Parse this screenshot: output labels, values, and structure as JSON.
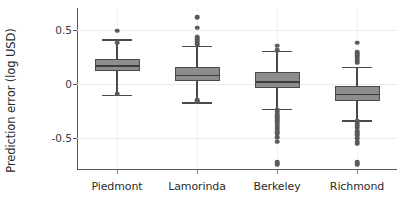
{
  "chart_data": {
    "type": "box",
    "title": "",
    "xlabel": "",
    "ylabel": "Prediction error (log USD)",
    "categories": [
      "Piedmont",
      "Lamorinda",
      "Berkeley",
      "Richmond"
    ],
    "ytick_labels": [
      "0.5",
      "0",
      "-0.5"
    ],
    "ytick_values": [
      0.5,
      0,
      -0.5
    ],
    "ylim": [
      -0.79,
      0.7
    ],
    "grid": "horizontal-and-vertical-light",
    "legend": "none",
    "box_fill_color": "#8c8c8c",
    "box_edge_color": "#4a4a4a",
    "outlier_color": "#5a5a5a",
    "axis_color": "#555555",
    "gridline_color": "#ececec",
    "boxes": [
      {
        "category": "Piedmont",
        "whisker_high": 0.412,
        "q3": 0.235,
        "median": 0.176,
        "q1": 0.118,
        "whisker_low": -0.098,
        "outliers_high": [
          0.49,
          0.382
        ],
        "outliers_low": [
          -0.088
        ]
      },
      {
        "category": "Lamorinda",
        "whisker_high": 0.353,
        "q3": 0.157,
        "median": 0.088,
        "q1": 0.029,
        "whisker_low": -0.167,
        "outliers_high": [
          0.618,
          0.52,
          0.431,
          0.412,
          0.392,
          0.373,
          0.363
        ],
        "outliers_low": [
          -0.157,
          -0.147
        ]
      },
      {
        "category": "Berkeley",
        "whisker_high": 0.304,
        "q3": 0.108,
        "median": 0.029,
        "q1": -0.039,
        "whisker_low": -0.225,
        "outliers_high": [
          0.353,
          0.314
        ],
        "outliers_low": [
          -0.235,
          -0.255,
          -0.275,
          -0.294,
          -0.314,
          -0.333,
          -0.353,
          -0.373,
          -0.392,
          -0.412,
          -0.431,
          -0.451,
          -0.49,
          -0.53,
          -0.716,
          -0.735
        ]
      },
      {
        "category": "Richmond",
        "whisker_high": 0.157,
        "q3": -0.02,
        "median": -0.088,
        "q1": -0.157,
        "whisker_low": -0.333,
        "outliers_high": [
          0.382,
          0.294,
          0.275,
          0.255,
          0.235,
          0.216,
          0.196
        ],
        "outliers_low": [
          -0.343,
          -0.363,
          -0.382,
          -0.402,
          -0.431,
          -0.451,
          -0.471,
          -0.5,
          -0.53,
          -0.549,
          -0.716,
          -0.735
        ]
      }
    ]
  }
}
